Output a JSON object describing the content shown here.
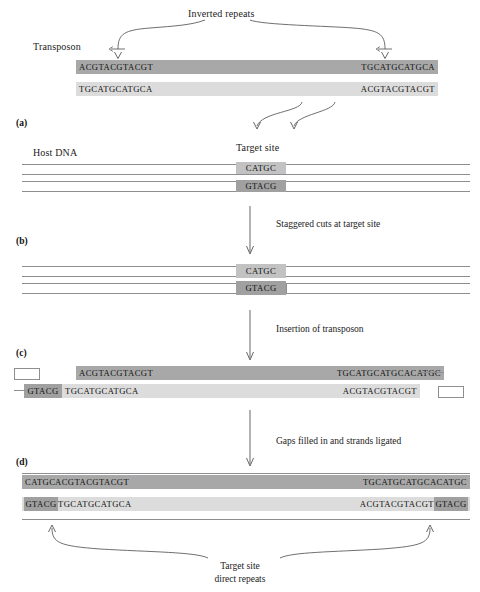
{
  "figure": {
    "top_label": "Inverted repeats",
    "transposon_label": "Transposon",
    "host_dna_label": "Host DNA",
    "target_site_label": "Target site",
    "bottom_label_line1": "Target site",
    "bottom_label_line2": "direct repeats"
  },
  "panels": [
    {
      "id": "a",
      "label": "(a)"
    },
    {
      "id": "b",
      "label": "(b)"
    },
    {
      "id": "c",
      "label": "(c)"
    },
    {
      "id": "d",
      "label": "(d)"
    }
  ],
  "steps": [
    {
      "id": "step1",
      "caption": "Staggered cuts at target site"
    },
    {
      "id": "step2",
      "caption": "Insertion of transposon"
    },
    {
      "id": "step3",
      "caption": "Gaps filled in and strands ligated"
    }
  ],
  "panel_a": {
    "top_strand_left": "ACGTACGTACGT",
    "top_strand_right": "TGCATGCATGCA",
    "bottom_strand_left": "TGCATGCATGCA",
    "bottom_strand_right": "ACGTACGTACGT"
  },
  "panel_b": {
    "target_top": "CATGC",
    "target_bottom": "GTACG"
  },
  "panel_c_cut": {
    "target_top": "CATGC",
    "target_bottom": "GTACG"
  },
  "panel_c": {
    "top_strand_left": "ACGTACGTACGT",
    "top_strand_right": "TGCATGCATGCACATGC",
    "bottom_overhang": "GTACG",
    "bottom_strand_left": "TGCATGCATGCA",
    "bottom_strand_right": "ACGTACGTACGT"
  },
  "panel_d": {
    "top_duplicate": "CATGC",
    "top_strand_left": "ACGTACGTACGT",
    "top_strand_right": "TGCATGCATGCACATGC",
    "bottom_duplicate_left": "GTACG",
    "bottom_strand_left": "TGCATGCATGCA",
    "bottom_strand_right": "ACGTACGTACGT",
    "bottom_duplicate_right": "GTACG"
  },
  "colors": {
    "transposon_top": "#a8a8a8",
    "transposon_bottom": "#dcdcdc",
    "target_site_top": "#c2c2c2",
    "target_site_bottom": "#a0a0a0",
    "dna_line": "#8d8d92",
    "arrow": "#55555a",
    "text": "#1a1a1a",
    "background": "#ffffff"
  }
}
